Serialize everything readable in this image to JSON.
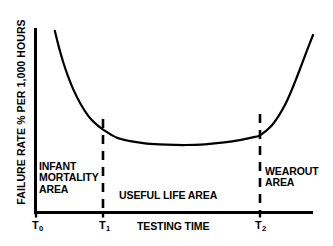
{
  "figure": {
    "background_color": "#ffffff",
    "ink_color": "#000000"
  },
  "axes": {
    "ylabel": "FAILURE RATE % PER 1,000 HOURS",
    "xlabel": "TESTING TIME"
  },
  "ticks": {
    "t0": {
      "base": "T",
      "sub": "0"
    },
    "t1": {
      "base": "T",
      "sub": "1"
    },
    "t2": {
      "base": "T",
      "sub": "2"
    }
  },
  "regions": {
    "infant": "INFANT\nMORTALITY\nAREA",
    "infant_lines": [
      "INFANT",
      "MORTALITY",
      "AREA"
    ],
    "useful": "USEFUL LIFE AREA",
    "wearout": "WEAROUT\nAREA",
    "wearout_lines": [
      "WEAROUT",
      "AREA"
    ]
  },
  "chart_data": {
    "type": "line",
    "title": "",
    "subtitle": "",
    "xlabel": "TESTING TIME",
    "ylabel": "FAILURE RATE % PER 1,000 HOURS",
    "grid": false,
    "legend": "none",
    "xlim": [
      0,
      1
    ],
    "ylim": [
      0,
      1
    ],
    "xtick_labels": [
      "T0",
      "T1",
      "T2"
    ],
    "xtick_positions": [
      0.0,
      0.245,
      0.81
    ],
    "ytick_labels": [],
    "annotations": [
      {
        "text": "INFANT MORTALITY AREA",
        "region": [
          0.0,
          0.245
        ]
      },
      {
        "text": "USEFUL LIFE AREA",
        "region": [
          0.245,
          0.81
        ]
      },
      {
        "text": "WEAROUT AREA",
        "region": [
          0.81,
          1.0
        ]
      }
    ],
    "vertical_dashed_lines": [
      {
        "label": "T1",
        "x": 0.245
      },
      {
        "label": "T2",
        "x": 0.81
      }
    ],
    "series": [
      {
        "name": "bathtub failure rate curve",
        "x": [
          0.068,
          0.082,
          0.098,
          0.115,
          0.135,
          0.16,
          0.19,
          0.215,
          0.245,
          0.29,
          0.34,
          0.4,
          0.47,
          0.54,
          0.61,
          0.68,
          0.74,
          0.79,
          0.81,
          0.845,
          0.875,
          0.9,
          0.925,
          0.95,
          0.975,
          1.0
        ],
        "y": [
          0.985,
          0.9,
          0.815,
          0.74,
          0.665,
          0.59,
          0.52,
          0.48,
          0.445,
          0.405,
          0.385,
          0.372,
          0.366,
          0.364,
          0.368,
          0.378,
          0.392,
          0.408,
          0.418,
          0.46,
          0.52,
          0.585,
          0.67,
          0.765,
          0.865,
          0.962
        ]
      }
    ]
  }
}
